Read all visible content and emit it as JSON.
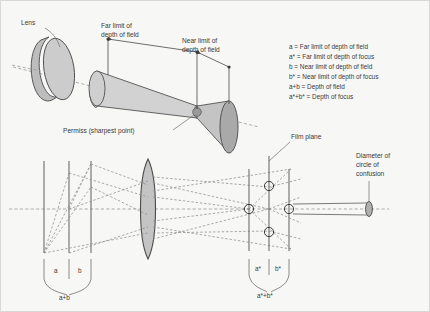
{
  "upper": {
    "lens_label": "Lens",
    "far_limit_label_line1": "Far limit of",
    "far_limit_label_line2": "depth of field",
    "near_limit_label_line1": "Near limit of",
    "near_limit_label_line2": "depth of field",
    "permiss_label": "Permiss (sharpest point)"
  },
  "legend": {
    "items": [
      "a = Far limit of depth of field",
      "a* = Far limit of depth of focus",
      "b = Near limit of depth of field",
      "b* = Near limit of depth of focus",
      "a+b = Depth of field",
      "a*+b* = Depth of focus"
    ]
  },
  "lower": {
    "brace_left": {
      "a": "a",
      "b": "b",
      "total": "a+b"
    },
    "brace_right": {
      "a_star": "a*",
      "b_star": "b*",
      "total": "a*+b*"
    },
    "film_plane_label": "Film plane",
    "coc_label_line1": "Diameter of",
    "coc_label_line2": "circle of",
    "coc_label_line3": "confusion"
  },
  "colors": {
    "background": "#f7f7f5",
    "cone_fill": "#c9c9c9",
    "cone_fill_light": "#d6d6d6",
    "cone_cap_dark": "#a9a9a9",
    "lens_fill": "#c4c4c4",
    "outline": "#4a4a4a",
    "ray": "#8d8d8d",
    "text": "#3a3a3a"
  }
}
